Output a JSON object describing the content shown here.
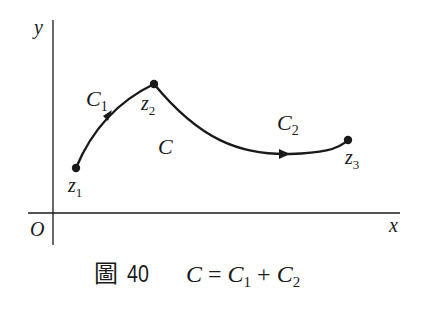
{
  "figure": {
    "axes": {
      "x_label": "x",
      "y_label": "y",
      "origin_label": "O"
    },
    "points": [
      {
        "id": "z1",
        "base": "z",
        "sub": "1"
      },
      {
        "id": "z2",
        "base": "z",
        "sub": "2"
      },
      {
        "id": "z3",
        "base": "z",
        "sub": "3"
      }
    ],
    "curves": [
      {
        "id": "C1",
        "base": "C",
        "sub": "1",
        "from": "z1",
        "to": "z2"
      },
      {
        "id": "C2",
        "base": "C",
        "sub": "2",
        "from": "z2",
        "to": "z3"
      }
    ],
    "region_label": "C",
    "caption": {
      "prefix": "圖",
      "number": "40",
      "eq_lhs": "C",
      "eq_sign": "=",
      "term1_base": "C",
      "term1_sub": "1",
      "plus": "+",
      "term2_base": "C",
      "term2_sub": "2"
    },
    "colors": {
      "ink": "#1a1a1a",
      "background": "#ffffff"
    }
  }
}
